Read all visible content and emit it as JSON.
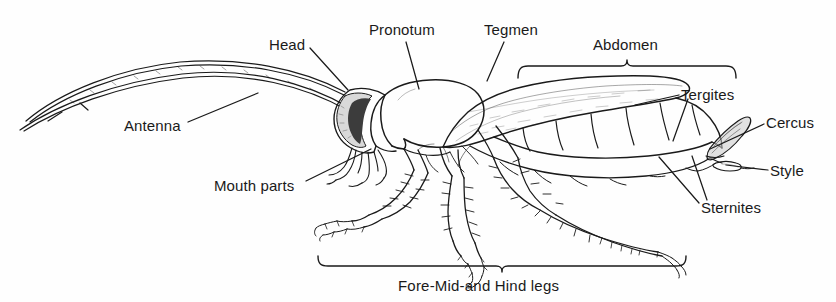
{
  "figure": {
    "background_color": "#fefefe",
    "ink_color": "#1a1a1a",
    "width": 836,
    "height": 302
  },
  "labels": {
    "antenna": "Antenna",
    "head": "Head",
    "pronotum": "Pronotum",
    "tegmen": "Tegmen",
    "abdomen": "Abdomen",
    "tergites": "Tergites",
    "cercus": "Cercus",
    "style": "Style",
    "sternites": "Sternites",
    "mouth_parts": "Mouth parts",
    "legs_bracket": "Fore-Mid-and Hind legs"
  },
  "label_positions": {
    "antenna": {
      "x": 124,
      "y": 117
    },
    "head": {
      "x": 269,
      "y": 36
    },
    "pronotum": {
      "x": 369,
      "y": 21
    },
    "tegmen": {
      "x": 484,
      "y": 21
    },
    "abdomen": {
      "x": 593,
      "y": 36
    },
    "tergites": {
      "x": 681,
      "y": 86
    },
    "cercus": {
      "x": 766,
      "y": 114
    },
    "style": {
      "x": 770,
      "y": 162
    },
    "sternites": {
      "x": 701,
      "y": 199
    },
    "mouth_parts": {
      "x": 214,
      "y": 177
    },
    "legs_bracket": {
      "x": 398,
      "y": 277
    }
  },
  "brackets": [
    {
      "name": "abdomen-bracket",
      "label": "Abdomen",
      "orientation": "up",
      "x_start": 518,
      "x_end": 736,
      "y": 66,
      "tick_x": 627
    },
    {
      "name": "legs-bracket",
      "label": "Fore-Mid-and Hind legs",
      "orientation": "down",
      "x_start": 318,
      "x_end": 686,
      "y": 265,
      "tick_x": 502
    }
  ],
  "leader_lines": [
    {
      "name": "antenna-leader",
      "from": [
        188,
        122
      ],
      "to": [
        258,
        93
      ]
    },
    {
      "name": "head-leader",
      "from": [
        310,
        48
      ],
      "to": [
        348,
        90
      ]
    },
    {
      "name": "pronotum-leader",
      "from": [
        406,
        42
      ],
      "to": [
        419,
        89
      ]
    },
    {
      "name": "tegmen-leader",
      "from": [
        504,
        42
      ],
      "to": [
        487,
        81
      ]
    },
    {
      "name": "tergites-leader-a",
      "from": [
        679,
        95
      ],
      "to": [
        635,
        105
      ]
    },
    {
      "name": "tergites-leader-b",
      "from": [
        688,
        99
      ],
      "to": [
        673,
        140
      ]
    },
    {
      "name": "cercus-leader",
      "from": [
        764,
        124
      ],
      "to": [
        711,
        148
      ]
    },
    {
      "name": "style-leader",
      "from": [
        768,
        170
      ],
      "to": [
        724,
        163
      ]
    },
    {
      "name": "sternites-leader-a",
      "from": [
        699,
        203
      ],
      "to": [
        661,
        158
      ]
    },
    {
      "name": "sternites-leader-b",
      "from": [
        705,
        200
      ],
      "to": [
        690,
        155
      ]
    },
    {
      "name": "mouth-parts-leader",
      "from": [
        306,
        181
      ],
      "to": [
        370,
        148
      ]
    }
  ],
  "anatomy_parts": [
    "antenna-upper",
    "antenna-lower",
    "head-capsule",
    "compound-eye",
    "mouth-parts",
    "pronotum",
    "tegmen",
    "abdomen-tergites",
    "abdomen-sternites",
    "cercus",
    "style",
    "foreleg",
    "midleg",
    "hindleg"
  ]
}
